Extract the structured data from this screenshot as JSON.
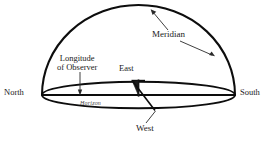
{
  "figure": {
    "background_color": "#ffffff",
    "line_color": "#000000",
    "text_color": "#1a1a1a"
  },
  "labels": {
    "meridian": "Meridian",
    "longitude_line1": "Longitude",
    "longitude_line2": "of Observer",
    "east": "East",
    "west": "West",
    "north": "North",
    "south": "South",
    "horizon": "Horizon"
  },
  "geometry": {
    "dome_left_x": 42,
    "dome_right_x": 235,
    "dome_apex_y": 5,
    "horizon_center_y": 95,
    "horizon_rx": 96,
    "horizon_ry": 13,
    "observer_tick_x": 80,
    "east_marker_x": 138
  }
}
